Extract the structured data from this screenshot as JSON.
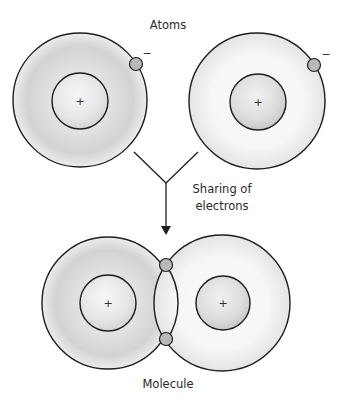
{
  "labels": {
    "top_title": "Atoms",
    "process_line1": "Sharing of",
    "process_line2": "electrons",
    "bottom_title": "Molecule"
  },
  "symbols": {
    "nucleus_charge": "+",
    "electron_charge": "−"
  },
  "colors": {
    "stroke": "#1e1e1e",
    "electron_fill": "#b9b9b9",
    "shell_dark": "#c4c4c4",
    "shell_light": "#f3f3f3",
    "nucleus_fill": "#d6d6d6",
    "background": "#ffffff"
  },
  "atoms": [
    {
      "id": "left-atom",
      "cx": 80,
      "cy": 100,
      "outer_r": 67,
      "inner_r": 28,
      "electron": {
        "cx": 136,
        "cy": 64
      },
      "minus": {
        "x": 147,
        "y": 56
      }
    },
    {
      "id": "right-atom",
      "cx": 257,
      "cy": 101,
      "outer_r": 68,
      "inner_r": 28,
      "electron": {
        "cx": 314,
        "cy": 65
      },
      "minus": {
        "x": 326,
        "y": 57
      }
    }
  ],
  "molecule": {
    "left_atom": {
      "cx": 108,
      "cy": 303,
      "outer_r": 66,
      "inner_r": 28
    },
    "right_atom": {
      "cx": 222,
      "cy": 303,
      "outer_r": 68,
      "inner_r": 27
    },
    "shared_electrons": [
      {
        "cx": 166,
        "cy": 265
      },
      {
        "cx": 166,
        "cy": 338
      }
    ]
  }
}
